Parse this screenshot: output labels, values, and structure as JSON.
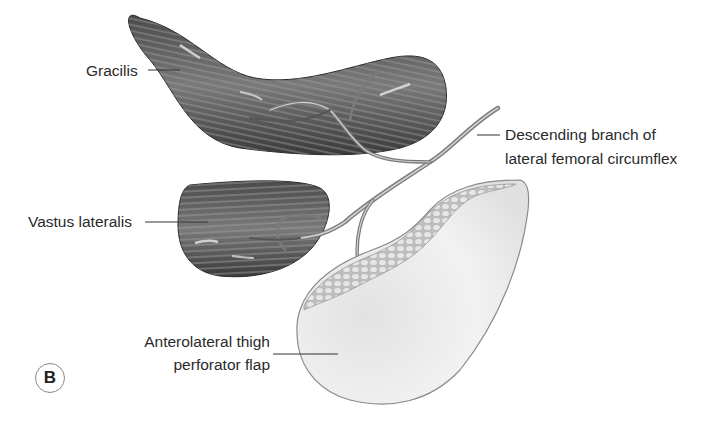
{
  "figure": {
    "panel_label": "B",
    "labels": {
      "gracilis": "Gracilis",
      "descending_branch_line1": "Descending branch of",
      "descending_branch_line2": "lateral femoral circumflex",
      "vastus_lateralis": "Vastus lateralis",
      "alt_flap_line1": "Anterolateral thigh",
      "alt_flap_line2": "perforator flap"
    },
    "colors": {
      "muscle_dark": "#3c3c3c",
      "muscle_mid": "#6e6e6e",
      "muscle_light": "#a8a8a8",
      "vessel": "#8a8a8a",
      "flap_skin": "#eeeeee",
      "flap_fat": "#cfcfcf",
      "leader_line": "#333333"
    }
  }
}
